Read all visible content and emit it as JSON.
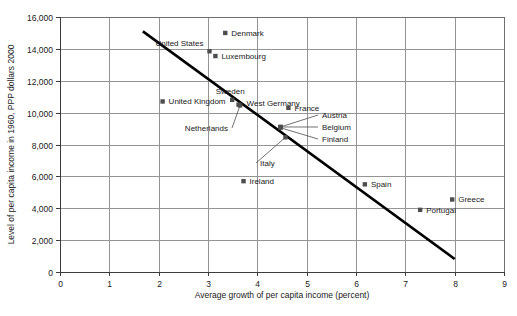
{
  "chart_data": {
    "type": "scatter",
    "title": "",
    "xlabel": "Average growth of per capita income (percent)",
    "ylabel": "Level of per capita income in 1960, PPP dollars 2000",
    "xlim": [
      0,
      9
    ],
    "ylim": [
      0,
      16000
    ],
    "xticks": [
      "0",
      "1",
      "2",
      "3",
      "4",
      "5",
      "6",
      "7",
      "8",
      "9"
    ],
    "yticks": [
      "0",
      "2,000",
      "4,000",
      "6,000",
      "8,000",
      "10,000",
      "12,000",
      "14,000",
      "16,000"
    ],
    "grid": true,
    "legend": "none",
    "marker_color": "#4d4d4d",
    "trendline_color": "#000000",
    "points": [
      {
        "name": "Denmark",
        "x": 3.35,
        "y": 15000,
        "label_dx": 6,
        "label_dy": 3,
        "anchor": "start",
        "leader": false
      },
      {
        "name": "United States",
        "x": 3.03,
        "y": 13850,
        "label_dx": -6,
        "label_dy": -5,
        "anchor": "end",
        "leader": false
      },
      {
        "name": "Luxembourg",
        "x": 3.15,
        "y": 13550,
        "label_dx": 6,
        "label_dy": 3,
        "anchor": "start",
        "leader": false
      },
      {
        "name": "United Kingdom",
        "x": 2.08,
        "y": 10700,
        "label_dx": 6,
        "label_dy": 3,
        "anchor": "start",
        "leader": false
      },
      {
        "name": "Sweden",
        "x": 3.49,
        "y": 10800,
        "label_dx": -2,
        "label_dy": -6,
        "anchor": "middle",
        "leader": false
      },
      {
        "name": "West Germany",
        "x": 3.62,
        "y": 10500,
        "label_dx": 8,
        "label_dy": 1,
        "anchor": "start",
        "leader": false
      },
      {
        "name": "France",
        "x": 4.63,
        "y": 10300,
        "label_dx": 6,
        "label_dy": 3,
        "anchor": "start",
        "leader": false
      },
      {
        "name": "Netherlands",
        "x": 3.65,
        "y": 10450,
        "label_dx": 0,
        "label_dy": 0,
        "anchor": "end",
        "leader": true,
        "lx": 232,
        "ly": 131
      },
      {
        "name": "Austria",
        "x": 4.47,
        "y": 9100,
        "label_dx": 0,
        "label_dy": 0,
        "anchor": "start",
        "leader": true,
        "lx": 318,
        "ly": 118
      },
      {
        "name": "Belgium",
        "x": 4.47,
        "y": 9100,
        "label_dx": 0,
        "label_dy": 0,
        "anchor": "start",
        "leader": true,
        "lx": 318,
        "ly": 130
      },
      {
        "name": "Finland",
        "x": 4.47,
        "y": 9050,
        "label_dx": 0,
        "label_dy": 0,
        "anchor": "start",
        "leader": true,
        "lx": 318,
        "ly": 142
      },
      {
        "name": "Italy",
        "x": 4.57,
        "y": 8450,
        "label_dx": 0,
        "label_dy": 0,
        "anchor": "start",
        "leader": true,
        "lx": 256,
        "ly": 166
      },
      {
        "name": "Ireland",
        "x": 3.72,
        "y": 5700,
        "label_dx": 6,
        "label_dy": 3,
        "anchor": "start",
        "leader": false
      },
      {
        "name": "Spain",
        "x": 6.18,
        "y": 5500,
        "label_dx": 6,
        "label_dy": 3,
        "anchor": "start",
        "leader": false
      },
      {
        "name": "Greece",
        "x": 7.95,
        "y": 4550,
        "label_dx": 6,
        "label_dy": 3,
        "anchor": "start",
        "leader": false
      },
      {
        "name": "Portugal",
        "x": 7.3,
        "y": 3900,
        "label_dx": 6,
        "label_dy": 3,
        "anchor": "start",
        "leader": false
      }
    ],
    "trendline": {
      "x1": 1.68,
      "y1": 15100,
      "x2": 8.0,
      "y2": 820
    }
  }
}
